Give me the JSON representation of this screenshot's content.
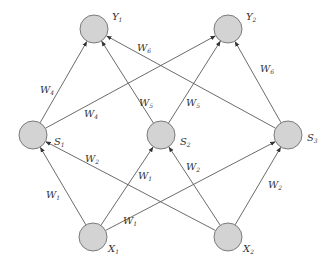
{
  "diagram": {
    "type": "neural-network",
    "colors": {
      "node_fill": "#d3d3d3",
      "node_stroke": "#7a7a7a",
      "edge": "#5a5a5a",
      "text": "#333333"
    },
    "nodes": [
      {
        "id": "Y1",
        "base": "Y",
        "sub": "1",
        "layer": "output",
        "x": 94,
        "y": 29
      },
      {
        "id": "Y2",
        "base": "Y",
        "sub": "2",
        "layer": "output",
        "x": 228,
        "y": 29
      },
      {
        "id": "S1",
        "base": "S",
        "sub": "1",
        "layer": "hidden",
        "x": 33,
        "y": 135
      },
      {
        "id": "S2",
        "base": "S",
        "sub": "2",
        "layer": "hidden",
        "x": 161,
        "y": 135
      },
      {
        "id": "S3",
        "base": "S",
        "sub": "3",
        "layer": "hidden",
        "x": 288,
        "y": 135
      },
      {
        "id": "X1",
        "base": "X",
        "sub": "1",
        "layer": "input",
        "x": 93,
        "y": 237
      },
      {
        "id": "X2",
        "base": "X",
        "sub": "2",
        "layer": "input",
        "x": 228,
        "y": 237
      }
    ],
    "edges": [
      {
        "from": "X1",
        "to": "S1",
        "weight": "W1"
      },
      {
        "from": "X1",
        "to": "S2",
        "weight": "W1"
      },
      {
        "from": "X1",
        "to": "S3",
        "weight": "W1"
      },
      {
        "from": "X2",
        "to": "S1",
        "weight": "W2"
      },
      {
        "from": "X2",
        "to": "S2",
        "weight": "W2"
      },
      {
        "from": "X2",
        "to": "S3",
        "weight": "W2"
      },
      {
        "from": "S1",
        "to": "Y1",
        "weight": "W4"
      },
      {
        "from": "S1",
        "to": "Y2",
        "weight": "W4"
      },
      {
        "from": "S2",
        "to": "Y1",
        "weight": "W5"
      },
      {
        "from": "S2",
        "to": "Y2",
        "weight": "W5"
      },
      {
        "from": "S3",
        "to": "Y1",
        "weight": "W6"
      },
      {
        "from": "S3",
        "to": "Y2",
        "weight": "W6"
      }
    ],
    "labels": {
      "Y1": {
        "base": "Y",
        "sub": "1"
      },
      "Y2": {
        "base": "Y",
        "sub": "2"
      },
      "S1": {
        "base": "S",
        "sub": "1"
      },
      "S2": {
        "base": "S",
        "sub": "2"
      },
      "S3": {
        "base": "S",
        "sub": "3"
      },
      "X1": {
        "base": "X",
        "sub": "1"
      },
      "X2": {
        "base": "X",
        "sub": "2"
      },
      "w_x1_s1": {
        "base": "W",
        "sub": "1"
      },
      "w_x1_s2": {
        "base": "W",
        "sub": "1"
      },
      "w_x1_s3": {
        "base": "W",
        "sub": "1"
      },
      "w_x2_s1": {
        "base": "W",
        "sub": "2"
      },
      "w_x2_s2": {
        "base": "W",
        "sub": "2"
      },
      "w_x2_s3": {
        "base": "W",
        "sub": "2"
      },
      "w_s1_y1": {
        "base": "W",
        "sub": "4"
      },
      "w_s1_y2": {
        "base": "W",
        "sub": "4"
      },
      "w_s2_y1": {
        "base": "W",
        "sub": "5"
      },
      "w_s2_y2": {
        "base": "W",
        "sub": "5"
      },
      "w_s3_y1": {
        "base": "W",
        "sub": "6"
      },
      "w_s3_y2": {
        "base": "W",
        "sub": "6"
      }
    }
  }
}
